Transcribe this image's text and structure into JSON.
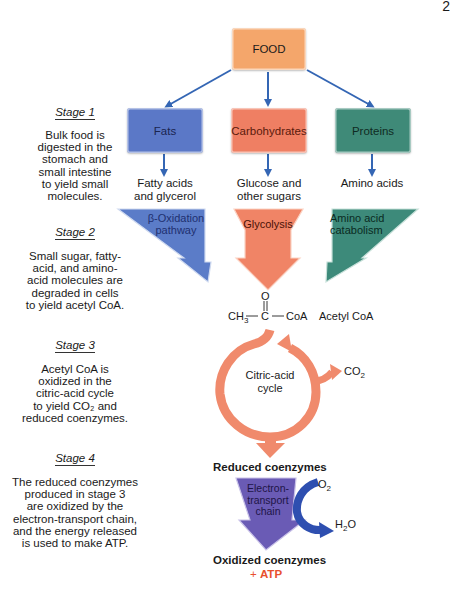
{
  "page_number": "2",
  "food": {
    "label": "FOOD",
    "color": "#f4a66b"
  },
  "macronutrients": [
    {
      "label": "Fats",
      "color": "#5b78c7",
      "product_line1": "Fatty acids",
      "product_line2": "and glycerol",
      "pathway_line1": "β-Oxidation",
      "pathway_line2": "pathway",
      "pathway_color": "#5b7cc8"
    },
    {
      "label": "Carbohydrates",
      "color": "#ef7f63",
      "product_line1": "Glucose and",
      "product_line2": "other sugars",
      "pathway_line1": "Glycolysis",
      "pathway_line2": "",
      "pathway_color": "#f08466"
    },
    {
      "label": "Proteins",
      "color": "#3f8a78",
      "product_line1": "Amino acids",
      "product_line2": "",
      "pathway_line1": "Amino acid",
      "pathway_line2": "catabolism",
      "pathway_color": "#3d8a7a"
    }
  ],
  "stages": [
    {
      "title": "Stage 1",
      "lines": [
        "Bulk food is",
        "digested in the",
        "stomach and",
        "small intestine",
        "to yield small",
        "molecules."
      ]
    },
    {
      "title": "Stage 2",
      "lines": [
        "Small sugar, fatty-",
        "acid, and amino-",
        "acid molecules are",
        "degraded in cells",
        "to yield acetyl CoA."
      ]
    },
    {
      "title": "Stage 3",
      "lines": [
        "Acetyl CoA is",
        "oxidized in the",
        "citric-acid cycle",
        "to yield CO₂ and",
        "reduced coenzymes."
      ]
    },
    {
      "title": "Stage 4",
      "lines": [
        "The reduced coenzymes",
        "produced in stage 3",
        "are oxidized by the",
        "electron-transport chain,",
        "and the energy released",
        "is used to make ATP."
      ]
    }
  ],
  "acetyl_coa": {
    "oxygen": "O",
    "ch3": "CH",
    "ch3_sub": "3",
    "carbon": "C",
    "coa": "CoA",
    "name": "Acetyl CoA"
  },
  "citric_cycle": {
    "line1": "Citric-acid",
    "line2": "cycle",
    "co2": "CO",
    "co2_sub": "2",
    "color": "#f08a6c"
  },
  "etc": {
    "reduced": "Reduced coenzymes",
    "line1": "Electron-",
    "line2": "transport",
    "line3": "chain",
    "o2": "O",
    "o2_sub": "2",
    "h2o_h": "H",
    "h2o_sub": "2",
    "h2o_o": "O",
    "oxidized": "Oxidized coenzymes",
    "plus": "+ ",
    "atp": "ATP",
    "color": "#6a5bb5",
    "arrow_color": "#2e4fb0",
    "atp_color": "#e8502e"
  },
  "arrow_color": "#3466b4"
}
